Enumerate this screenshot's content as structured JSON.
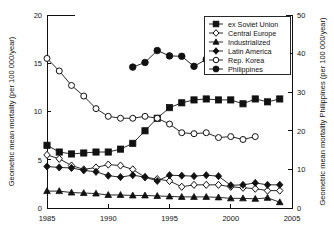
{
  "chart_data": {
    "type": "line",
    "title": "",
    "xlabel": "",
    "ylabel": "Geometric mean mortality (per 100 000/year)",
    "y2label": "Geometric mean mortality Philippines (per 100 000/year)",
    "xlim": [
      1985,
      2005
    ],
    "ylim": [
      0,
      20
    ],
    "y2lim": [
      0,
      50
    ],
    "xticks": [
      "1985",
      "1990",
      "1995",
      "2000",
      "2005"
    ],
    "xtick_values": [
      1985,
      1990,
      1995,
      2000,
      2005
    ],
    "yticks": [
      "0",
      "5",
      "10",
      "15",
      "20"
    ],
    "ytick_values": [
      0,
      5,
      10,
      15,
      20
    ],
    "y2ticks": [
      "0",
      "10",
      "20",
      "30",
      "40",
      "50"
    ],
    "y2tick_values": [
      0,
      10,
      20,
      30,
      40,
      50
    ],
    "grid": false,
    "legend_position": "top-right",
    "series": [
      {
        "name": "ex Soviet Union",
        "marker": "filled-square",
        "axis": "left",
        "x": [
          1985,
          1986,
          1987,
          1988,
          1989,
          1990,
          1991,
          1992,
          1993,
          1994,
          1995,
          1996,
          1997,
          1998,
          1999,
          2000,
          2001,
          2002,
          2003,
          2004
        ],
        "values": [
          6.5,
          5.8,
          5.6,
          5.7,
          5.8,
          5.8,
          6.1,
          6.7,
          8.0,
          9.3,
          10.4,
          10.9,
          11.2,
          11.3,
          11.2,
          11.2,
          10.8,
          11.3,
          11.0,
          11.3
        ]
      },
      {
        "name": "Central Europe",
        "marker": "open-diamond",
        "axis": "left",
        "x": [
          1985,
          1986,
          1987,
          1988,
          1989,
          1990,
          1991,
          1992,
          1993,
          1994,
          1995,
          1996,
          1997,
          1998,
          1999,
          2000,
          2001,
          2002,
          2003,
          2004
        ],
        "values": [
          5.5,
          5.1,
          4.4,
          4.0,
          4.2,
          4.5,
          4.4,
          4.0,
          3.2,
          3.0,
          2.8,
          2.2,
          2.4,
          2.4,
          2.4,
          2.2,
          2.1,
          2.0,
          1.8,
          1.8
        ]
      },
      {
        "name": "Industrialized",
        "marker": "filled-triangle",
        "axis": "left",
        "x": [
          1985,
          1986,
          1987,
          1988,
          1989,
          1990,
          1991,
          1992,
          1993,
          1994,
          1995,
          1996,
          1997,
          1998,
          1999,
          2000,
          2001,
          2002,
          2003,
          2004
        ],
        "values": [
          1.75,
          1.75,
          1.6,
          1.55,
          1.5,
          1.35,
          1.35,
          1.3,
          1.3,
          1.25,
          1.2,
          1.15,
          1.15,
          1.15,
          1.1,
          1.0,
          1.0,
          0.95,
          1.05,
          0.6
        ]
      },
      {
        "name": "Latin America",
        "marker": "filled-diamond",
        "axis": "left",
        "x": [
          1985,
          1986,
          1987,
          1988,
          1989,
          1990,
          1991,
          1992,
          1993,
          1994,
          1995,
          1996,
          1997,
          1998,
          1999,
          2000,
          2001,
          2002,
          2003,
          2004
        ],
        "values": [
          4.3,
          4.2,
          4.15,
          3.9,
          3.75,
          3.35,
          3.2,
          3.4,
          3.2,
          2.8,
          3.4,
          3.35,
          3.3,
          3.4,
          3.3,
          2.35,
          2.4,
          2.6,
          2.4,
          2.4
        ]
      },
      {
        "name": "Rep. Korea",
        "marker": "open-circle",
        "axis": "left",
        "x": [
          1985,
          1986,
          1987,
          1988,
          1989,
          1990,
          1991,
          1992,
          1993,
          1994,
          1995,
          1996,
          1997,
          1998,
          1999,
          2000,
          2001,
          2002
        ],
        "values": [
          15.5,
          14.2,
          12.7,
          11.6,
          10.3,
          9.5,
          9.3,
          9.3,
          9.5,
          9.3,
          8.7,
          7.8,
          7.7,
          7.8,
          7.3,
          7.4,
          7.1,
          7.4
        ]
      },
      {
        "name": "Philippines",
        "marker": "filled-circle",
        "axis": "right",
        "x": [
          1992,
          1993,
          1994,
          1995,
          1996,
          1997,
          1998
        ],
        "values": [
          36.5,
          37.7,
          40.8,
          39.4,
          39.3,
          36.7,
          38.5
        ]
      }
    ]
  },
  "legend": {
    "entries": [
      {
        "label": "ex Soviet Union"
      },
      {
        "label": "Central Europe"
      },
      {
        "label": "Industrialized"
      },
      {
        "label": "Latin America"
      },
      {
        "label": "Rep. Korea"
      },
      {
        "label": "Philippines"
      }
    ]
  },
  "colors": {
    "ink": "#111111",
    "background": "#ffffff"
  }
}
